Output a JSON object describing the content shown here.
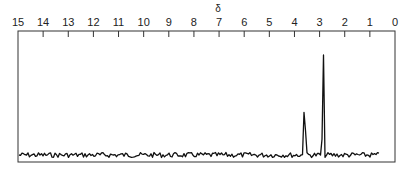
{
  "chart_data": {
    "type": "line",
    "title": "",
    "xlabel": "δ",
    "ylabel": "",
    "x_axis_position": "top",
    "xlim": [
      15,
      0
    ],
    "x_reversed": true,
    "tick_labels": [
      "15",
      "14",
      "13",
      "12",
      "11",
      "10",
      "9",
      "8",
      "7",
      "6",
      "5",
      "4",
      "3",
      "2",
      "1",
      "0"
    ],
    "grid": false,
    "legend": null,
    "series": [
      {
        "name": "spectrum",
        "peaks": [
          {
            "ppm": 3.6,
            "relative_height": 0.58
          },
          {
            "ppm": 2.85,
            "relative_height": 1.0
          },
          {
            "ppm": 0.35,
            "relative_height": 0.95
          }
        ],
        "baseline_noise": true
      }
    ]
  }
}
